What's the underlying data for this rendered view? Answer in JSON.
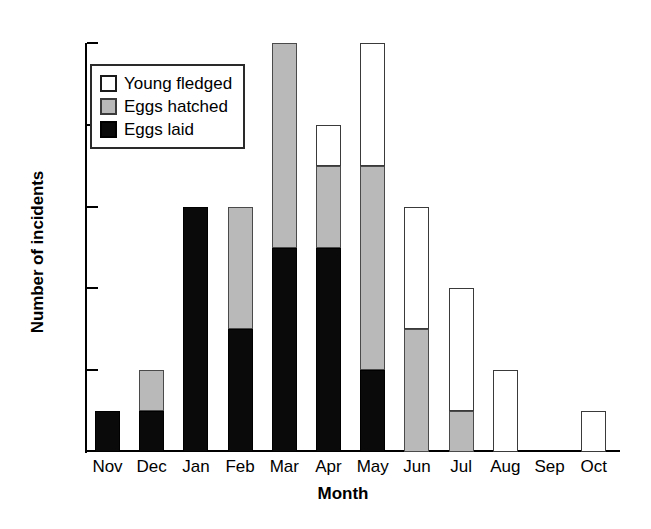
{
  "chart_data": {
    "type": "bar",
    "subtype": "stacked-bar",
    "title": "",
    "xlabel": "Month",
    "ylabel": "Number of incidents",
    "categories": [
      "Nov",
      "Dec",
      "Jan",
      "Feb",
      "Mar",
      "Apr",
      "May",
      "Jun",
      "Jul",
      "Aug",
      "Sep",
      "Oct"
    ],
    "series": [
      {
        "name": "Eggs laid",
        "color": "#0a0a0a",
        "values": [
          1,
          1,
          6,
          3,
          5,
          5,
          2,
          0,
          0,
          0,
          0,
          0
        ]
      },
      {
        "name": "Eggs hatched",
        "color": "#b9b9b9",
        "values": [
          0,
          1,
          0,
          3,
          5,
          2,
          5,
          3,
          1,
          0,
          0,
          0
        ]
      },
      {
        "name": "Young fledged",
        "color": "#ffffff",
        "values": [
          0,
          0,
          0,
          0,
          0,
          1,
          3,
          3,
          3,
          2,
          0,
          1
        ]
      }
    ],
    "totals": [
      1,
      2,
      6,
      6,
      10,
      8,
      10,
      6,
      4,
      2,
      0,
      1
    ],
    "ylim": [
      0,
      10
    ],
    "yticks": [
      2,
      4,
      6,
      8,
      10
    ],
    "ytick_labels": [
      "2",
      "4",
      "6",
      "8",
      "10"
    ],
    "grid": false,
    "legend_position": "upper-left",
    "legend_order": [
      "Young fledged",
      "Eggs hatched",
      "Eggs laid"
    ]
  },
  "legend": {
    "items": [
      {
        "label": "Young fledged",
        "swatch": "white"
      },
      {
        "label": "Eggs hatched",
        "swatch": "gray"
      },
      {
        "label": "Eggs laid",
        "swatch": "black"
      }
    ]
  },
  "axes": {
    "y_title": "Number of incidents",
    "x_title": "Month"
  }
}
